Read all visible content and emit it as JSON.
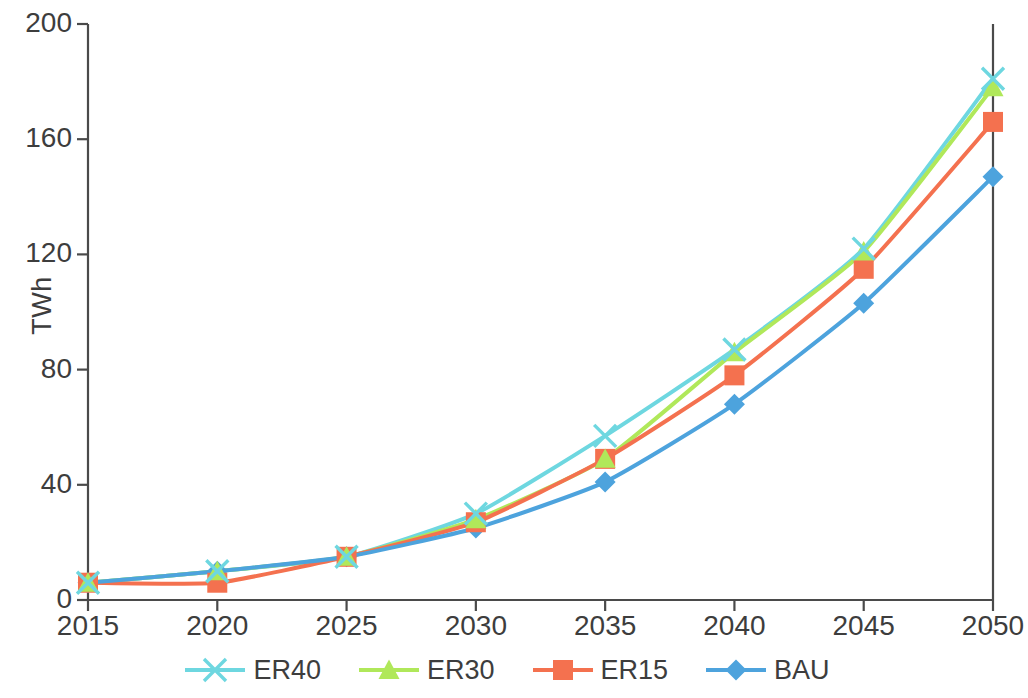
{
  "chart_data": {
    "type": "line",
    "title": "",
    "xlabel": "",
    "ylabel": "TWh",
    "x": [
      2015,
      2020,
      2025,
      2030,
      2035,
      2040,
      2045,
      2050
    ],
    "xtick_labels": [
      "2015",
      "2020",
      "2025",
      "2030",
      "2035",
      "2040",
      "2045",
      "2050"
    ],
    "ytick_labels": [
      "0",
      "40",
      "80",
      "120",
      "160",
      "200"
    ],
    "yticks": [
      0,
      40,
      80,
      120,
      160,
      200
    ],
    "ylim": [
      0,
      200
    ],
    "xlim": [
      2015,
      2050
    ],
    "grid": false,
    "legend_position": "bottom",
    "series": [
      {
        "name": "ER40",
        "color": "#6ed7e0",
        "marker": "x",
        "values": [
          6,
          10,
          15,
          30,
          57,
          87,
          122,
          181
        ]
      },
      {
        "name": "ER30",
        "color": "#b0e85a",
        "marker": "triangle",
        "values": [
          6,
          10,
          15,
          28,
          49,
          86,
          121,
          178
        ]
      },
      {
        "name": "ER15",
        "color": "#f4714f",
        "marker": "square",
        "values": [
          6,
          6,
          15,
          27,
          49,
          78,
          115,
          166
        ]
      },
      {
        "name": "BAU",
        "color": "#4da3dd",
        "marker": "diamond",
        "values": [
          6,
          10,
          15,
          25,
          41,
          68,
          103,
          147
        ]
      }
    ]
  },
  "axis": {
    "y_title": "TWh"
  },
  "legend": {
    "items": [
      {
        "label": "ER40",
        "color": "#6ed7e0",
        "marker": "x-marker"
      },
      {
        "label": "ER30",
        "color": "#b0e85a",
        "marker": "triangle-marker"
      },
      {
        "label": "ER15",
        "color": "#f4714f",
        "marker": "square-marker"
      },
      {
        "label": "BAU",
        "color": "#4da3dd",
        "marker": "diamond-marker"
      }
    ]
  },
  "colors": {
    "axis": "#4a4a4a",
    "text": "#3d3d3d",
    "background": "#ffffff"
  }
}
